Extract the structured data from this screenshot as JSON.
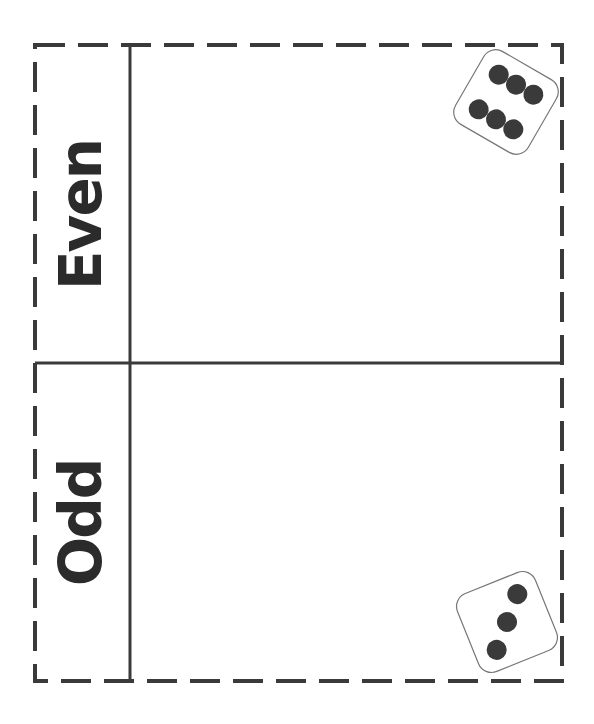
{
  "sorting_mat": {
    "sections": [
      {
        "label": "Even",
        "example_die": {
          "face": 6
        }
      },
      {
        "label": "Odd",
        "example_die": {
          "face": 3
        }
      }
    ]
  },
  "colors": {
    "ink": "#333333",
    "pip": "#3a3a3a",
    "die_border": "#777777"
  }
}
